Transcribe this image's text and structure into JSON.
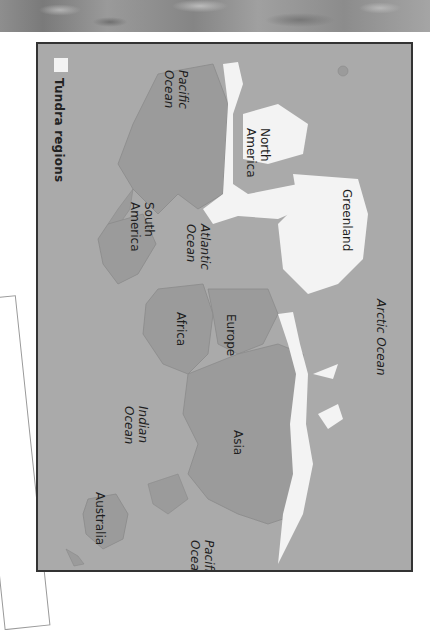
{
  "legend": {
    "label": "Tundra regions",
    "swatch_color": "#f3f3f3"
  },
  "colors": {
    "ocean": "#aaaaaa",
    "land": "#9b9b9b",
    "tundra": "#f3f3f3",
    "frame_border": "#333333"
  },
  "labels": {
    "pacific_ocean_east": "Pacific\nOcean",
    "north_america": "North\nAmerica",
    "greenland": "Greenland",
    "arctic_ocean": "Arctic Ocean",
    "south_america": "South\nAmerica",
    "atlantic_ocean": "Atlantic\nOcean",
    "africa": "Africa",
    "europe": "Europe",
    "indian_ocean": "Indian\nOcean",
    "asia": "Asia",
    "australia": "Australia",
    "pacific_ocean_west": "Pacific\nOcean"
  },
  "orientation": "rotated 90° clockwise"
}
